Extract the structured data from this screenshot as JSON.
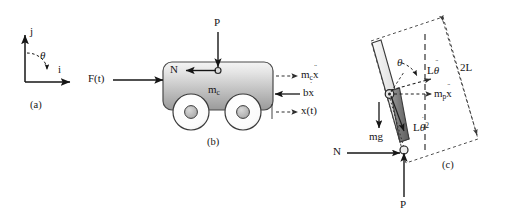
{
  "figure": {
    "width": 508,
    "height": 221,
    "background": "#ffffff",
    "ink": "#161616"
  },
  "panel_a": {
    "caption": "(a)",
    "axis_j_label": "j",
    "axis_i_label": "i",
    "angle_label": "θ",
    "description": "unit vector coordinate frame with j vertical, i horizontal and theta measured clockwise from j toward i"
  },
  "panel_b": {
    "caption": "(b)",
    "applied_force_label": "F(t)",
    "pivot_force_label": "P",
    "normal_force_label": "N",
    "cart_mass_label": "m",
    "cart_mass_sub": "c",
    "inertia_label": "m",
    "inertia_sub": "c",
    "inertia_var": "x",
    "inertia_dots": "¨",
    "damping_label": "b",
    "damping_var": "x",
    "damping_dots": "˙",
    "position_label": "x(t)",
    "description": "cart of mass m_c on two wheels with applied force F(t), reaction N and P at the pendulum pivot, inertial force m_c x-double-dot, damping force b x-dot and displacement x(t)"
  },
  "panel_c": {
    "caption": "(c)",
    "angle_label": "θ",
    "length_label": "2L",
    "tangential_label": "L",
    "tangential_var": "θ",
    "tangential_dots": "¨",
    "centripetal_label": "L",
    "centripetal_var": "θ",
    "centripetal_dots": "˙",
    "centripetal_power": "2",
    "pendulum_inertia_label": "m",
    "pendulum_inertia_sub": "p",
    "pendulum_inertia_var": "x",
    "pendulum_inertia_dots": "¨",
    "weight_label": "mg",
    "normal_force_label": "N",
    "pivot_force_label": "P",
    "description": "pendulum rod of length 2L inclined from vertical by theta, with center of mass marker, inertial terms L theta-double-dot and L theta-dot squared, m_p x-double-dot, weight mg, and pivot reactions N and P"
  },
  "colors": {
    "ink": "#161616",
    "rod_light": "#e9e9e9",
    "rod_dark": "#6f6f6f",
    "cart_light": "#e8e8e8",
    "cart_mid": "#b5b5b5",
    "cart_dark": "#8c8c8c",
    "wheel_fill": "#fdfdfd",
    "hub_fill": "#b9b9b9",
    "dash": "#3a3a3a"
  }
}
